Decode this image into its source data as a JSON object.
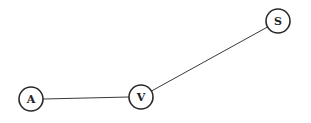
{
  "diagram": {
    "type": "undirected-graph",
    "node_radius": 12,
    "colors": {
      "background": "#ffffff",
      "stroke": "#2a2a2a",
      "edge": "#3a3a3a",
      "label": "#222222"
    },
    "nodes": [
      {
        "id": "A",
        "label": "A",
        "x": 31,
        "y": 99
      },
      {
        "id": "V",
        "label": "V",
        "x": 141,
        "y": 97
      },
      {
        "id": "S",
        "label": "S",
        "x": 278,
        "y": 21
      }
    ],
    "edges": [
      {
        "from": "A",
        "to": "V"
      },
      {
        "from": "V",
        "to": "S"
      }
    ]
  }
}
